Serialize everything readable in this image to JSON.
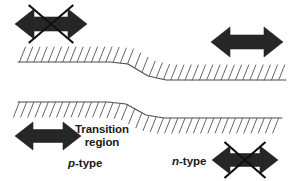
{
  "figure": {
    "background_color": "#ffffff",
    "band_line_color": "#4d4d4d",
    "hatch_color": "#666666",
    "arrow_color": "#262626",
    "cross_color": "#111111"
  },
  "labels": {
    "transition_line1": "Transition",
    "transition_line2": "region",
    "p_type_italic": "p",
    "p_type_rest": "-type",
    "n_type_italic": "n",
    "n_type_rest": "-type"
  },
  "arrows": [
    {
      "id": "top-left-arrow",
      "name": "top-left-double-arrow-crossed",
      "crossed": true,
      "cx": 51,
      "cy": 24,
      "half_width": 36,
      "shaft_half_height": 7,
      "head_half_height": 15,
      "head_length": 19
    },
    {
      "id": "top-right-arrow",
      "name": "top-right-double-arrow",
      "crossed": false,
      "cx": 247,
      "cy": 42,
      "half_width": 36,
      "shaft_half_height": 7,
      "head_half_height": 15,
      "head_length": 19
    },
    {
      "id": "bottom-left-arrow",
      "name": "bottom-left-double-arrow",
      "crossed": false,
      "cx": 48,
      "cy": 136,
      "half_width": 33,
      "shaft_half_height": 6.5,
      "head_half_height": 14,
      "head_length": 18
    },
    {
      "id": "bottom-right-arrow",
      "name": "bottom-right-double-arrow-crossed",
      "crossed": true,
      "cx": 245,
      "cy": 160,
      "half_width": 33,
      "shaft_half_height": 6.5,
      "head_half_height": 14,
      "head_length": 18
    }
  ],
  "chart_data": {
    "type": "line",
    "xlabel": "",
    "ylabel": "",
    "grid": false,
    "legend_position": "none",
    "annotations": [
      "Transition region",
      "p-type",
      "n-type"
    ],
    "series": [
      {
        "name": "conduction-band-edge",
        "hatch_side": "above",
        "x": [
          18,
          110,
          128,
          148,
          166,
          286
        ],
        "y": [
          62,
          62,
          64,
          76,
          80,
          80
        ]
      },
      {
        "name": "valence-band-edge",
        "hatch_side": "below",
        "x": [
          18,
          108,
          126,
          146,
          164,
          282
        ],
        "y": [
          102,
          102,
          104,
          115,
          118,
          118
        ]
      }
    ],
    "hatching": {
      "top_band": {
        "spacing": 7.2,
        "length": 15,
        "dx": 6,
        "direction": "up-right"
      },
      "bottom_band": {
        "spacing": 7.2,
        "length": 15,
        "dx": 6,
        "direction": "down-left"
      }
    }
  }
}
